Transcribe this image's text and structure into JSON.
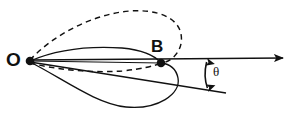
{
  "figure": {
    "type": "geometric-diagram",
    "background_color": "#ffffff",
    "stroke_color": "#111111",
    "width": 296,
    "height": 117
  },
  "labels": {
    "origin": "O",
    "point_b": "B",
    "angle": "θ"
  },
  "points": {
    "origin": {
      "x": 30,
      "y": 61,
      "marker": "filled-dot"
    },
    "point_b": {
      "x": 161,
      "y": 63,
      "marker": "filled-dot"
    }
  },
  "rays": {
    "horizontal": {
      "x1": 30,
      "y1": 60,
      "x2": 288,
      "y2": 58,
      "arrowhead": true,
      "style": "solid"
    },
    "slanted": {
      "x1": 30,
      "y1": 62,
      "x2": 226,
      "y2": 93,
      "arrowhead": false,
      "style": "solid"
    },
    "chord_to_b": {
      "x1": 30,
      "y1": 61,
      "x2": 161,
      "y2": 63,
      "style": "solid"
    }
  },
  "curves": {
    "upper_dashed_loop": {
      "style": "dashed",
      "apex": {
        "x": 158,
        "y": 12
      },
      "from": "O",
      "to": "B"
    },
    "lower_dashed_return": {
      "style": "dashed",
      "sag": {
        "x": 100,
        "y": 72
      },
      "from": "O",
      "to": "B"
    },
    "upper_solid_lens": {
      "style": "solid",
      "apex": {
        "x": 100,
        "y": 50
      },
      "from": "O",
      "to": "B"
    },
    "lower_solid_loop": {
      "style": "solid",
      "apex": {
        "x": 120,
        "y": 107
      },
      "from": "O",
      "to": "B"
    }
  },
  "angle_marker": {
    "symbol": "θ",
    "arc_x": 207,
    "arc_top_y": 58,
    "arc_bottom_y": 91,
    "double_headed": true
  }
}
